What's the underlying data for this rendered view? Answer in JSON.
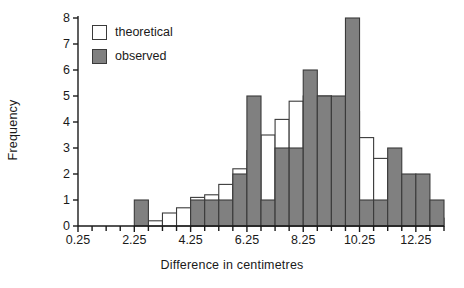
{
  "chart_data": {
    "type": "bar",
    "title": "",
    "subtitle": "",
    "xlabel": "Difference in centimetres",
    "ylabel": "Frequency",
    "xlim": [
      0.25,
      13.25
    ],
    "ylim": [
      0,
      8
    ],
    "bin_width": 0.5,
    "grid": false,
    "legend_position": "top-left",
    "x_tick_labels": [
      "0.25",
      "2.25",
      "4.25",
      "6.25",
      "8.25",
      "10.25",
      "12.25"
    ],
    "x_tick_values": [
      0.25,
      2.25,
      4.25,
      6.25,
      8.25,
      10.25,
      12.25
    ],
    "x_minor_tick_step": 0.5,
    "y_tick_labels": [
      "0",
      "1",
      "2",
      "3",
      "4",
      "5",
      "6",
      "7",
      "8"
    ],
    "y_tick_values": [
      0,
      1,
      2,
      3,
      4,
      5,
      6,
      7,
      8
    ],
    "categories": [
      "0.25-0.75",
      "0.75-1.25",
      "1.25-1.75",
      "1.75-2.25",
      "2.25-2.75",
      "2.75-3.25",
      "3.25-3.75",
      "3.75-4.25",
      "4.25-4.75",
      "4.75-5.25",
      "5.25-5.75",
      "5.75-6.25",
      "6.25-6.75",
      "6.75-7.25",
      "7.25-7.75",
      "7.75-8.25",
      "8.25-8.75",
      "8.75-9.25",
      "9.25-9.75",
      "9.75-10.25",
      "10.25-10.75",
      "10.75-11.25",
      "11.25-11.75",
      "11.75-12.25",
      "12.25-12.75",
      "12.75-13.25"
    ],
    "bin_starts": [
      0.25,
      0.75,
      1.25,
      1.75,
      2.25,
      2.75,
      3.25,
      3.75,
      4.25,
      4.75,
      5.25,
      5.75,
      6.25,
      6.75,
      7.25,
      7.75,
      8.25,
      8.75,
      9.25,
      9.75,
      10.25,
      10.75,
      11.25,
      11.75,
      12.25,
      12.75
    ],
    "series": [
      {
        "name": "theoretical",
        "fill": "#ffffff",
        "stroke": "#3a3a3a",
        "values": [
          0,
          0,
          0,
          0,
          0,
          0.2,
          0.5,
          0.7,
          1.1,
          1.2,
          1.6,
          2.2,
          2.9,
          3.5,
          4.1,
          4.8,
          5.0,
          5.0,
          4.8,
          4.4,
          3.4,
          2.6,
          1.7,
          1.1,
          0.6,
          0.3
        ]
      },
      {
        "name": "observed",
        "fill": "#808080",
        "stroke": "#3a3a3a",
        "values": [
          0,
          0,
          0,
          0,
          1,
          0,
          0,
          0,
          1,
          1,
          1,
          2,
          5,
          1,
          3,
          3,
          6,
          5,
          5,
          8,
          1,
          1,
          3,
          2,
          2,
          1
        ]
      }
    ]
  },
  "legend": {
    "items": [
      {
        "label": "theoretical",
        "swatch": "#ffffff"
      },
      {
        "label": "observed",
        "swatch": "#808080"
      }
    ]
  },
  "colors": {
    "axis": "#1a1a1a",
    "observed_fill": "#808080",
    "theoretical_fill": "#ffffff",
    "bar_stroke": "#3a3a3a",
    "background": "#ffffff"
  }
}
